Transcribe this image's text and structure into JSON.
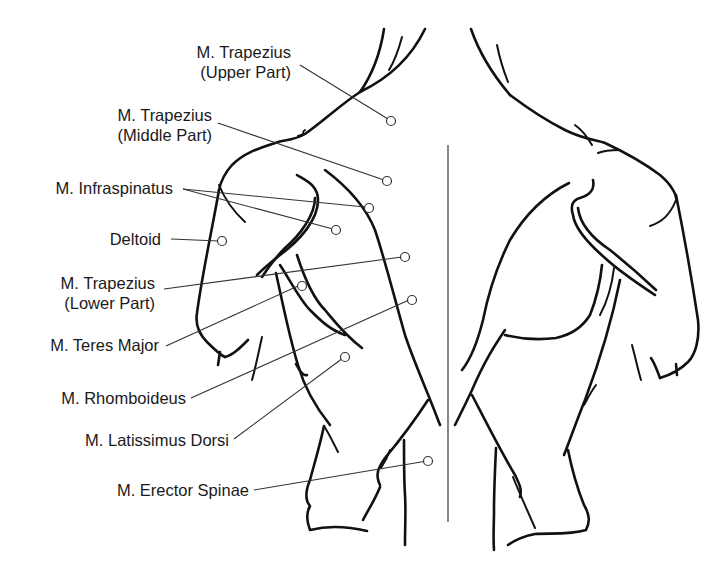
{
  "diagram": {
    "labels": [
      {
        "id": "trapezius-upper",
        "line1": "M. Trapezius",
        "line2": "(Upper Part)"
      },
      {
        "id": "trapezius-middle",
        "line1": "M. Trapezius",
        "line2": "(Middle Part)"
      },
      {
        "id": "infraspinatus",
        "line1": "M. Infraspinatus",
        "line2": ""
      },
      {
        "id": "deltoid",
        "line1": "Deltoid",
        "line2": ""
      },
      {
        "id": "trapezius-lower",
        "line1": "M. Trapezius",
        "line2": "(Lower Part)"
      },
      {
        "id": "teres-major",
        "line1": "M. Teres Major",
        "line2": ""
      },
      {
        "id": "rhomboideus",
        "line1": "M. Rhomboideus",
        "line2": ""
      },
      {
        "id": "latissimus-dorsi",
        "line1": "M. Latissimus Dorsi",
        "line2": ""
      },
      {
        "id": "erector-spinae",
        "line1": "M. Erector Spinae",
        "line2": ""
      }
    ],
    "colors": {
      "line": "#111111",
      "leader": "#333333",
      "background": "#ffffff"
    }
  }
}
